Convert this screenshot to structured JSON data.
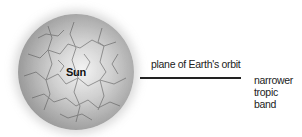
{
  "diagram": {
    "sun": {
      "label": "Sun",
      "icon": "sun-sphere-icon"
    },
    "orbit": {
      "label": "plane of Earth's orbit"
    },
    "tropic": {
      "line1": "narrower",
      "line2": "tropic band"
    }
  }
}
